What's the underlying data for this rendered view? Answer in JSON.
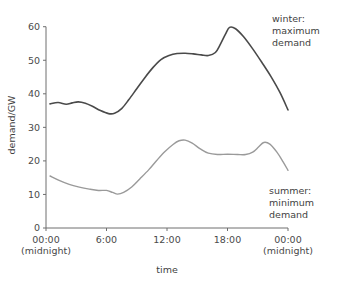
{
  "chart_data": {
    "type": "line",
    "title": "",
    "xlabel": "time",
    "ylabel": "demand/GW",
    "xlim": [
      0,
      24
    ],
    "ylim": [
      0,
      62
    ],
    "grid": false,
    "legend_position": "right",
    "x_ticks": [
      {
        "value": 0,
        "label": "00:00",
        "sublabel": "(midnight)"
      },
      {
        "value": 6,
        "label": "6:00",
        "sublabel": ""
      },
      {
        "value": 12,
        "label": "12:00",
        "sublabel": ""
      },
      {
        "value": 18,
        "label": "18:00",
        "sublabel": ""
      },
      {
        "value": 24,
        "label": "00:00",
        "sublabel": "(midnight)"
      }
    ],
    "y_ticks": [
      {
        "value": 0,
        "label": "0"
      },
      {
        "value": 10,
        "label": "10"
      },
      {
        "value": 20,
        "label": "20"
      },
      {
        "value": 30,
        "label": "30"
      },
      {
        "value": 40,
        "label": "40"
      },
      {
        "value": 50,
        "label": "50"
      },
      {
        "value": 60,
        "label": "60"
      }
    ],
    "series": [
      {
        "name": "winter",
        "legend_lines": [
          "winter:",
          "maximum",
          "demand"
        ],
        "color": "#4a4a4a",
        "width": 1.6,
        "x": [
          0.4,
          1.2,
          2.0,
          2.6,
          3.2,
          3.9,
          4.6,
          5.4,
          6.2,
          6.8,
          7.5,
          8.2,
          9.0,
          9.8,
          10.6,
          11.4,
          12.2,
          13.0,
          13.8,
          14.6,
          15.4,
          16.1,
          16.8,
          17.3,
          17.8,
          18.2,
          18.8,
          19.6,
          20.5,
          21.4,
          22.3,
          23.2,
          24.0
        ],
        "y": [
          37.0,
          37.4,
          36.9,
          37.3,
          37.6,
          37.2,
          36.3,
          35.0,
          34.1,
          34.2,
          35.6,
          38.2,
          41.5,
          44.8,
          47.8,
          50.2,
          51.4,
          52.0,
          52.1,
          51.9,
          51.6,
          51.4,
          52.3,
          54.8,
          57.8,
          59.8,
          59.4,
          57.0,
          53.4,
          49.4,
          45.2,
          40.4,
          35.2
        ]
      },
      {
        "name": "summer",
        "legend_lines": [
          "summer:",
          "minimum",
          "demand"
        ],
        "color": "#9a9a9a",
        "width": 1.4,
        "x": [
          0.4,
          1.3,
          2.3,
          3.3,
          4.3,
          5.2,
          6.0,
          6.6,
          7.1,
          7.7,
          8.5,
          9.3,
          10.2,
          11.0,
          11.8,
          12.6,
          13.2,
          13.8,
          14.5,
          15.3,
          16.1,
          17.0,
          18.0,
          19.0,
          19.8,
          20.5,
          21.1,
          21.6,
          22.2,
          22.9,
          23.5,
          24.0
        ],
        "y": [
          15.5,
          14.2,
          13.0,
          12.2,
          11.6,
          11.2,
          11.2,
          10.6,
          10.1,
          10.6,
          12.2,
          14.6,
          17.4,
          20.2,
          22.8,
          24.9,
          26.0,
          26.2,
          25.3,
          23.6,
          22.3,
          21.9,
          22.0,
          21.9,
          21.9,
          22.6,
          24.2,
          25.5,
          25.0,
          22.6,
          19.8,
          17.2
        ]
      }
    ]
  },
  "colors": {
    "background": "#ffffff",
    "axis": "#6e6e6e",
    "text": "#3f3f3f",
    "winter_line": "#4a4a4a",
    "summer_line": "#9a9a9a"
  }
}
